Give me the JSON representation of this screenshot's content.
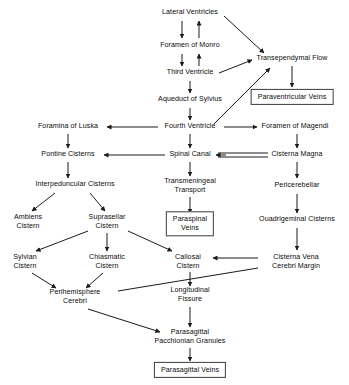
{
  "diagram": {
    "type": "flowchart",
    "background_color": "#ffffff",
    "text_color": "#0b0b0b",
    "line_color": "#1a1a1a",
    "nodes": [
      {
        "id": "lateral_ventricles",
        "label": "Lateral Ventricles",
        "lines": [
          "Lateral Ventricles"
        ],
        "x": 190,
        "y": 13,
        "boxed": false
      },
      {
        "id": "foramen_of_monro",
        "label": "Foramen of Monro",
        "lines": [
          "Foramen of Monro"
        ],
        "x": 190,
        "y": 46,
        "boxed": false
      },
      {
        "id": "third_ventricle",
        "label": "Third Ventricle",
        "lines": [
          "Third Ventricle"
        ],
        "x": 190,
        "y": 73,
        "boxed": false
      },
      {
        "id": "aqueduct_of_sylvius",
        "label": "Aqueduct of Sylvius",
        "lines": [
          "Aqueduct of Sylvius"
        ],
        "x": 190,
        "y": 100,
        "boxed": false
      },
      {
        "id": "fourth_ventricle",
        "label": "Fourth Ventricle",
        "lines": [
          "Fourth Ventricle"
        ],
        "x": 190,
        "y": 127,
        "boxed": false
      },
      {
        "id": "transependymal_flow",
        "label": "Transependymal Flow",
        "lines": [
          "Transependymal Flow"
        ],
        "x": 292,
        "y": 59,
        "boxed": false
      },
      {
        "id": "paraventricular_veins",
        "label": "Paraventricular Veins",
        "lines": [
          "Paraventricular Veins"
        ],
        "x": 292,
        "y": 97,
        "boxed": true
      },
      {
        "id": "foramina_of_luska",
        "label": "Foramina of Luska",
        "lines": [
          "Foramina of Luska"
        ],
        "x": 68,
        "y": 127,
        "boxed": false
      },
      {
        "id": "foramen_of_magendi",
        "label": "Foramen of Magendi",
        "lines": [
          "Foramen of Magendi"
        ],
        "x": 295,
        "y": 127,
        "boxed": false
      },
      {
        "id": "pontine_cisterns",
        "label": "Pontine Cisterns",
        "lines": [
          "Pontine Cisterns"
        ],
        "x": 68,
        "y": 155,
        "boxed": false
      },
      {
        "id": "spinal_canal",
        "label": "Spinal Canal",
        "lines": [
          "Spinal Canal"
        ],
        "x": 190,
        "y": 155,
        "boxed": false
      },
      {
        "id": "cisterna_magna",
        "label": "Cisterna Magna",
        "lines": [
          "Cisterna Magna"
        ],
        "x": 297,
        "y": 155,
        "boxed": false
      },
      {
        "id": "interpeduncular_cisterns",
        "label": "Interpeduncular Cisterns",
        "lines": [
          "Interpeduncular Cisterns"
        ],
        "x": 75,
        "y": 185,
        "boxed": false
      },
      {
        "id": "transmeningeal_transport",
        "label": "Transmeningeal Transport",
        "lines": [
          "Transmeningeal",
          "Transport"
        ],
        "x": 190,
        "y": 186,
        "boxed": false
      },
      {
        "id": "pericerebellar",
        "label": "Pericerebellar",
        "lines": [
          "Pericerebellar"
        ],
        "x": 297,
        "y": 186,
        "boxed": false
      },
      {
        "id": "ambiens_cistern",
        "label": "Ambiens Cistern",
        "lines": [
          "Ambiens",
          "Cistern"
        ],
        "x": 28,
        "y": 222,
        "boxed": false
      },
      {
        "id": "suprasellar_cistern",
        "label": "Suprasellar Cistern",
        "lines": [
          "Suprasellar",
          "Cistern"
        ],
        "x": 107,
        "y": 222,
        "boxed": false
      },
      {
        "id": "paraspinal_veins",
        "label": "Paraspinal Veins",
        "lines": [
          "Paraspinal",
          "Veins"
        ],
        "x": 190,
        "y": 224,
        "boxed": true
      },
      {
        "id": "quadrigeminal_cisterns",
        "label": "Ouadrigeminal Cisterns",
        "lines": [
          "Ouadrigeminal Cisterns"
        ],
        "x": 297,
        "y": 220,
        "boxed": false
      },
      {
        "id": "sylvian_cistern",
        "label": "Sylvian Cistern",
        "lines": [
          "Sylvian",
          "Cistern"
        ],
        "x": 25,
        "y": 262,
        "boxed": false
      },
      {
        "id": "chiasmatic_cistern",
        "label": "Chiasmatic Cistern",
        "lines": [
          "Chiasmatic",
          "Cistern"
        ],
        "x": 107,
        "y": 262,
        "boxed": false
      },
      {
        "id": "callosal_cistern",
        "label": "Callosal Cistern",
        "lines": [
          "Callosal",
          "Cistern"
        ],
        "x": 188,
        "y": 262,
        "boxed": false
      },
      {
        "id": "cisterna_vena_cerebri_margin",
        "label": "Cisterna Vena Cerebri Margin",
        "lines": [
          "Cisterna Vena",
          "Cerebri Margin"
        ],
        "x": 296,
        "y": 262,
        "boxed": false
      },
      {
        "id": "perihemisphere_cerebri",
        "label": "Perihemisphere Cerebri",
        "lines": [
          "Perihemisphere",
          "Cerebri"
        ],
        "x": 75,
        "y": 297,
        "boxed": false
      },
      {
        "id": "longitudinal_fissure",
        "label": "Longitudinal Fissure",
        "lines": [
          "Longitudinal",
          "Fissure"
        ],
        "x": 190,
        "y": 295,
        "boxed": false
      },
      {
        "id": "parasagittal_pacchionian_granules",
        "label": "Parasagittal Pacchionian Granules",
        "lines": [
          "Parasagittal",
          "Pacchionian Granules"
        ],
        "x": 190,
        "y": 337,
        "boxed": false
      },
      {
        "id": "parasagittal_veins",
        "label": "Parasagittal Veins",
        "lines": [
          "Parasagittal Veins"
        ],
        "x": 190,
        "y": 370,
        "boxed": true
      }
    ],
    "edges": [
      {
        "from": "lateral_ventricles",
        "to": "foramen_of_monro",
        "style": "single",
        "direction": "down"
      },
      {
        "from": "foramen_of_monro",
        "to": "lateral_ventricles",
        "style": "single",
        "direction": "up"
      },
      {
        "from": "foramen_of_monro",
        "to": "third_ventricle",
        "style": "single",
        "direction": "down"
      },
      {
        "from": "third_ventricle",
        "to": "foramen_of_monro",
        "style": "single",
        "direction": "up"
      },
      {
        "from": "third_ventricle",
        "to": "aqueduct_of_sylvius",
        "style": "single",
        "direction": "down"
      },
      {
        "from": "aqueduct_of_sylvius",
        "to": "fourth_ventricle",
        "style": "single",
        "direction": "down"
      },
      {
        "from": "lateral_ventricles",
        "to": "transependymal_flow",
        "style": "single",
        "direction": "diagonal"
      },
      {
        "from": "third_ventricle",
        "to": "transependymal_flow",
        "style": "single",
        "direction": "diagonal"
      },
      {
        "from": "fourth_ventricle",
        "to": "transependymal_flow",
        "style": "single",
        "direction": "diagonal"
      },
      {
        "from": "transependymal_flow",
        "to": "paraventricular_veins",
        "style": "single",
        "direction": "down"
      },
      {
        "from": "fourth_ventricle",
        "to": "foramina_of_luska",
        "style": "single",
        "direction": "left"
      },
      {
        "from": "fourth_ventricle",
        "to": "foramen_of_magendi",
        "style": "single",
        "direction": "right"
      },
      {
        "from": "foramina_of_luska",
        "to": "pontine_cisterns",
        "style": "single",
        "direction": "down"
      },
      {
        "from": "foramen_of_magendi",
        "to": "cisterna_magna",
        "style": "single",
        "direction": "down"
      },
      {
        "from": "fourth_ventricle",
        "to": "spinal_canal",
        "style": "single",
        "direction": "down"
      },
      {
        "from": "spinal_canal",
        "to": "pontine_cisterns",
        "style": "single",
        "direction": "left"
      },
      {
        "from": "cisterna_magna",
        "to": "spinal_canal",
        "style": "double",
        "direction": "left"
      },
      {
        "from": "pontine_cisterns",
        "to": "interpeduncular_cisterns",
        "style": "single",
        "direction": "down"
      },
      {
        "from": "spinal_canal",
        "to": "transmeningeal_transport",
        "style": "single",
        "direction": "down"
      },
      {
        "from": "cisterna_magna",
        "to": "pericerebellar",
        "style": "single",
        "direction": "down"
      },
      {
        "from": "transmeningeal_transport",
        "to": "paraspinal_veins",
        "style": "single",
        "direction": "down"
      },
      {
        "from": "pericerebellar",
        "to": "quadrigeminal_cisterns",
        "style": "single",
        "direction": "down"
      },
      {
        "from": "interpeduncular_cisterns",
        "to": "ambiens_cistern",
        "style": "single",
        "direction": "diagonal"
      },
      {
        "from": "interpeduncular_cisterns",
        "to": "suprasellar_cistern",
        "style": "single",
        "direction": "diagonal"
      },
      {
        "from": "suprasellar_cistern",
        "to": "sylvian_cistern",
        "style": "single",
        "direction": "diagonal"
      },
      {
        "from": "suprasellar_cistern",
        "to": "chiasmatic_cistern",
        "style": "single",
        "direction": "down"
      },
      {
        "from": "suprasellar_cistern",
        "to": "callosal_cistern",
        "style": "single",
        "direction": "diagonal"
      },
      {
        "from": "quadrigeminal_cisterns",
        "to": "cisterna_vena_cerebri_margin",
        "style": "single",
        "direction": "down"
      },
      {
        "from": "cisterna_vena_cerebri_margin",
        "to": "callosal_cistern",
        "style": "single",
        "direction": "left"
      },
      {
        "from": "cisterna_vena_cerebri_margin",
        "to": "perihemisphere_cerebri",
        "style": "single",
        "direction": "diagonal"
      },
      {
        "from": "sylvian_cistern",
        "to": "perihemisphere_cerebri",
        "style": "single",
        "direction": "diagonal"
      },
      {
        "from": "chiasmatic_cistern",
        "to": "perihemisphere_cerebri",
        "style": "single",
        "direction": "diagonal"
      },
      {
        "from": "callosal_cistern",
        "to": "longitudinal_fissure",
        "style": "single",
        "direction": "down"
      },
      {
        "from": "longitudinal_fissure",
        "to": "parasagittal_pacchionian_granules",
        "style": "single",
        "direction": "down"
      },
      {
        "from": "perihemisphere_cerebri",
        "to": "parasagittal_pacchionian_granules",
        "style": "single",
        "direction": "diagonal"
      },
      {
        "from": "parasagittal_pacchionian_granules",
        "to": "parasagittal_veins",
        "style": "single",
        "direction": "down"
      }
    ]
  }
}
